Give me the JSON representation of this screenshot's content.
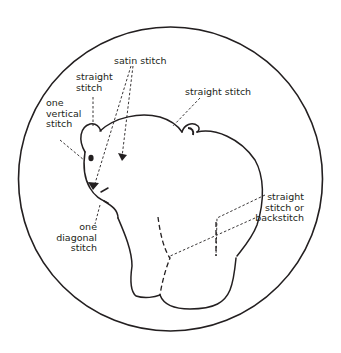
{
  "diagram": {
    "type": "embroidery stitch guide",
    "colors": {
      "line": "#231f20",
      "background": "#ffffff"
    },
    "labels": {
      "satin": "satin stitch",
      "straight_ear": "straight\nstitch",
      "vertical": "one\nvertical\nstitch",
      "straight_right": "straight stitch",
      "diagonal": "one\ndiagonal\nstitch",
      "backstitch": "straight\nstitch or\nbackstitch"
    }
  }
}
